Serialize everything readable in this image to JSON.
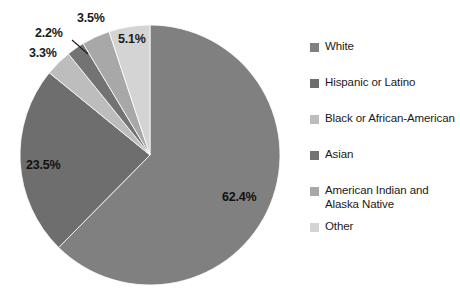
{
  "chart_data": {
    "type": "pie",
    "title": "",
    "subtitle": "",
    "xlabel": "",
    "ylabel": "",
    "legend_position": "right",
    "grid": false,
    "start_angle_deg": 0,
    "direction": "clockwise",
    "categories": [
      "White",
      "Hispanic or Latino",
      "Black or African-American",
      "Asian",
      "American Indian and Alaska Native",
      "Other"
    ],
    "values": [
      62.4,
      23.5,
      3.3,
      2.2,
      3.5,
      5.1
    ],
    "value_labels": [
      "62.4%",
      "23.5%",
      "3.3%",
      "2.2%",
      "3.5%",
      "5.1%"
    ],
    "colors": [
      "#808080",
      "#6e6e6e",
      "#bdbdbd",
      "#737373",
      "#a8a8a8",
      "#d4d4d4"
    ],
    "units": "percent"
  },
  "pie": {
    "labels": [
      {
        "text": "62.4%",
        "left": 222,
        "top": 190,
        "placement": "inside"
      },
      {
        "text": "23.5%",
        "left": 26,
        "top": 158,
        "placement": "inside"
      },
      {
        "text": "3.3%",
        "left": 29,
        "top": 46,
        "placement": "outside"
      },
      {
        "text": "2.2%",
        "left": 35,
        "top": 26,
        "placement": "outside"
      },
      {
        "text": "3.5%",
        "left": 77,
        "top": 11,
        "placement": "outside"
      },
      {
        "text": "5.1%",
        "left": 118,
        "top": 32,
        "placement": "outside"
      }
    ]
  },
  "legend": {
    "items": [
      {
        "label": "White",
        "color": "#808080"
      },
      {
        "label": "Hispanic or Latino",
        "color": "#6e6e6e"
      },
      {
        "label": "Black or African-American",
        "color": "#bdbdbd"
      },
      {
        "label": "Asian",
        "color": "#737373"
      },
      {
        "label": "American Indian and Alaska Native",
        "color": "#a8a8a8"
      },
      {
        "label": "Other",
        "color": "#d4d4d4"
      }
    ]
  }
}
